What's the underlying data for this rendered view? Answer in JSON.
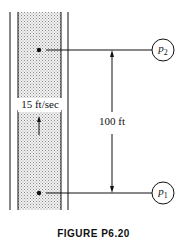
{
  "diagram": {
    "velocity_label": "15 ft/sec",
    "height_label": "100 ft",
    "upper_gauge": {
      "symbol": "p",
      "subscript": "2"
    },
    "lower_gauge": {
      "symbol": "p",
      "subscript": "1"
    },
    "caption": "FIGURE P6.20",
    "colors": {
      "line": "#111111",
      "fill_stipple": "#d8d8d8",
      "background": "#ffffff"
    }
  }
}
